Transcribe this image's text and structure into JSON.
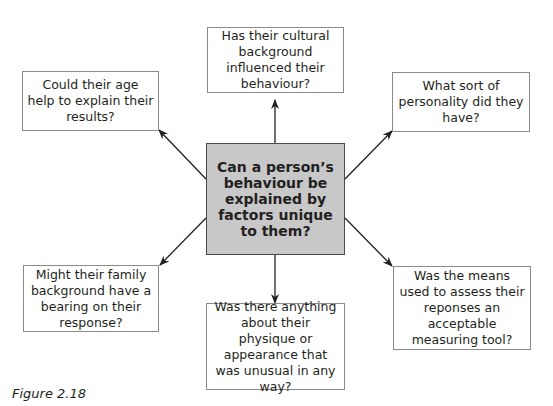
{
  "diagram": {
    "center": {
      "label": "Can a person’s behaviour be explained by factors unique to them?",
      "fill": "#c8c8c8"
    },
    "nodes": [
      {
        "id": "top",
        "label": "Has their cultural background influenced their behaviour?"
      },
      {
        "id": "upper-left",
        "label": "Could their age help to explain their results?"
      },
      {
        "id": "upper-right",
        "label": "What sort of personality did they have?"
      },
      {
        "id": "lower-left",
        "label": "Might their family background have a bearing on their response?"
      },
      {
        "id": "bottom",
        "label": "Was there anything about their physique or appearance that was unusual in any way?"
      },
      {
        "id": "lower-right",
        "label": "Was the means used to assess their reponses an acceptable measuring tool?"
      }
    ],
    "edges": [
      {
        "from": "center",
        "to": "top"
      },
      {
        "from": "center",
        "to": "upper-left"
      },
      {
        "from": "center",
        "to": "upper-right"
      },
      {
        "from": "center",
        "to": "lower-left"
      },
      {
        "from": "center",
        "to": "bottom"
      },
      {
        "from": "center",
        "to": "lower-right"
      }
    ]
  },
  "caption": "Figure 2.18"
}
